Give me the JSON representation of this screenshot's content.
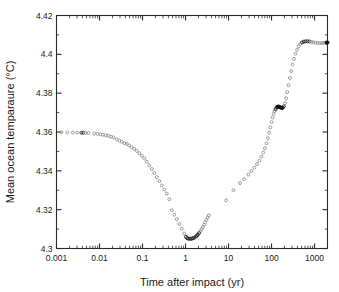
{
  "figure": {
    "background_color": "#ffffff",
    "frame_color": "#2b2b2b",
    "marker_color_early": "#8d8d8d",
    "marker_color_late": "#111111"
  },
  "chart_data": {
    "type": "scatter",
    "title": "",
    "xlabel": "Time after impact (yr)",
    "ylabel": "Mean ocean temparaure (°C)",
    "xscale": "log",
    "yscale": "linear",
    "xlim": [
      0.001,
      2000
    ],
    "ylim": [
      4.3,
      4.42
    ],
    "grid": false,
    "legend": null,
    "xticks": [
      0.001,
      0.01,
      0.1,
      1,
      10,
      100,
      1000
    ],
    "xtick_labels": [
      "0.001",
      "0.01",
      "0.1",
      "1",
      "10",
      "100",
      "1000"
    ],
    "yticks": [
      4.3,
      4.32,
      4.34,
      4.36,
      4.38,
      4.4,
      4.42
    ],
    "ytick_labels": [
      "4.3",
      "4.32",
      "4.34",
      "4.36",
      "4.38",
      "4.4",
      "4.42"
    ],
    "marker": "open-circle",
    "series": [
      {
        "name": "Mean ocean temperature",
        "x": [
          0.0013,
          0.0018,
          0.0024,
          0.003,
          0.0038,
          0.0042,
          0.0048,
          0.0055,
          0.0075,
          0.009,
          0.0105,
          0.012,
          0.014,
          0.016,
          0.0185,
          0.021,
          0.025,
          0.029,
          0.033,
          0.038,
          0.043,
          0.049,
          0.056,
          0.064,
          0.073,
          0.084,
          0.096,
          0.11,
          0.126,
          0.144,
          0.165,
          0.188,
          0.215,
          0.246,
          0.281,
          0.321,
          0.367,
          0.42,
          0.48,
          0.548,
          0.626,
          0.715,
          0.817,
          0.933,
          1.02,
          1.09,
          1.16,
          1.24,
          1.32,
          1.41,
          1.5,
          1.6,
          1.71,
          1.82,
          1.94,
          2.07,
          2.21,
          2.36,
          2.52,
          2.69,
          2.87,
          3.06,
          3.27,
          3.49,
          8.8,
          13.0,
          18.5,
          23.0,
          29.0,
          34.0,
          40.0,
          46.0,
          52.0,
          58.0,
          64.0,
          70.0,
          76.0,
          82.0,
          88.0,
          94.0,
          100.0,
          106.0,
          112.0,
          118.0,
          124.0,
          131.0,
          138.0,
          146.0,
          154.0,
          163.0,
          172.0,
          182.0,
          193.0,
          205.0,
          218.0,
          232.0,
          248.0,
          266.0,
          286.0,
          308.0,
          333.0,
          361.0,
          392.0,
          427.0,
          467.0,
          512.0,
          563.0,
          621.0,
          687.0,
          762.0,
          847.0,
          944.0,
          1054.0,
          1180.0,
          1324.0,
          1488.0,
          1676.0,
          1890.0,
          2000.0
        ],
        "y": [
          4.3598,
          4.3598,
          4.3597,
          4.3597,
          4.3596,
          4.3596,
          4.3595,
          4.3595,
          4.3592,
          4.359,
          4.3588,
          4.3586,
          4.3583,
          4.358,
          4.3576,
          4.3572,
          4.3563,
          4.3556,
          4.355,
          4.3543,
          4.3538,
          4.3531,
          4.3522,
          4.3513,
          4.3503,
          4.3491,
          4.3478,
          4.3464,
          4.3447,
          4.3428,
          4.3409,
          4.3389,
          4.3368,
          4.3347,
          4.3325,
          4.3304,
          4.3283,
          4.3253,
          4.3197,
          4.3174,
          4.3151,
          4.3126,
          4.3103,
          4.3077,
          4.306,
          4.3053,
          4.3051,
          4.305,
          4.305,
          4.3051,
          4.3053,
          4.3056,
          4.306,
          4.3065,
          4.3072,
          4.308,
          4.3089,
          4.3099,
          4.311,
          4.3122,
          4.3135,
          4.3148,
          4.316,
          4.3171,
          4.3248,
          4.33,
          4.3337,
          4.3357,
          4.3381,
          4.3399,
          4.3416,
          4.3434,
          4.3452,
          4.3473,
          4.3494,
          4.3516,
          4.3541,
          4.3568,
          4.3596,
          4.3624,
          4.3651,
          4.3675,
          4.3694,
          4.3708,
          4.3718,
          4.3726,
          4.373,
          4.3731,
          4.3729,
          4.3726,
          4.3724,
          4.3725,
          4.3732,
          4.3748,
          4.3773,
          4.3805,
          4.3841,
          4.3878,
          4.3914,
          4.3947,
          4.3977,
          4.4003,
          4.4024,
          4.4041,
          4.4053,
          4.4061,
          4.4065,
          4.4067,
          4.4067,
          4.4066,
          4.4064,
          4.4062,
          4.406,
          4.4059,
          4.4058,
          4.4058,
          4.4059,
          4.406,
          4.4061
        ],
        "marker": "open-circle",
        "notes": "Gray open circles early; markers overlap into a thick black trace after ~150 yr"
      }
    ],
    "annotations": [
      {
        "text": "initial temperature plateau",
        "x": 0.002,
        "y": 4.36
      },
      {
        "text": "minimum",
        "x": 1.3,
        "y": 4.305
      },
      {
        "text": "sparse sampling gap",
        "x": 5.5,
        "y": 4.32
      },
      {
        "text": "plateau / slight dip",
        "x": 160,
        "y": 4.373
      },
      {
        "text": "final value",
        "x": 2000,
        "y": 4.406
      }
    ]
  }
}
